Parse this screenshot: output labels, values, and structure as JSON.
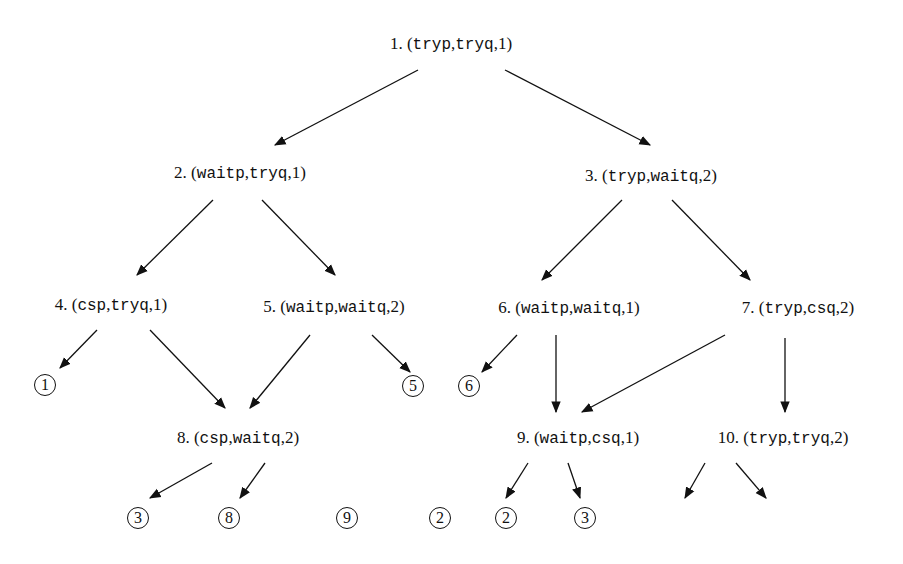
{
  "diagram": {
    "type": "state-space-tree",
    "nodes": [
      {
        "id": 1,
        "num": "1.",
        "p": "tryp",
        "q": "tryq",
        "t": "1",
        "x": 451,
        "y": 44
      },
      {
        "id": 2,
        "num": "2.",
        "p": "waitp",
        "q": "tryq",
        "t": "1",
        "x": 240,
        "y": 173
      },
      {
        "id": 3,
        "num": "3.",
        "p": "tryp",
        "q": "waitq",
        "t": "2",
        "x": 651,
        "y": 176
      },
      {
        "id": 4,
        "num": "4.",
        "p": "csp",
        "q": "tryq",
        "t": "1",
        "x": 111,
        "y": 305
      },
      {
        "id": 5,
        "num": "5.",
        "p": "waitp",
        "q": "waitq",
        "t": "2",
        "x": 334,
        "y": 307
      },
      {
        "id": 6,
        "num": "6.",
        "p": "waitp",
        "q": "waitq",
        "t": "1",
        "x": 569,
        "y": 308
      },
      {
        "id": 7,
        "num": "7.",
        "p": "tryp",
        "q": "csq",
        "t": "2",
        "x": 798,
        "y": 308
      },
      {
        "id": 8,
        "num": "8.",
        "p": "csp",
        "q": "waitq",
        "t": "2",
        "x": 238,
        "y": 438
      },
      {
        "id": 9,
        "num": "9.",
        "p": "waitp",
        "q": "csq",
        "t": "1",
        "x": 578,
        "y": 438
      },
      {
        "id": 10,
        "num": "10.",
        "p": "tryp",
        "q": "tryq",
        "t": "2",
        "x": 783,
        "y": 438
      }
    ],
    "refs": [
      {
        "label": "1",
        "x": 45,
        "y": 385
      },
      {
        "label": "5",
        "x": 413,
        "y": 386
      },
      {
        "label": "6",
        "x": 469,
        "y": 386
      },
      {
        "label": "3",
        "x": 138,
        "y": 518
      },
      {
        "label": "8",
        "x": 229,
        "y": 518
      },
      {
        "label": "9",
        "x": 347,
        "y": 518
      },
      {
        "label": "2",
        "x": 440,
        "y": 518
      },
      {
        "label": "2",
        "x": 506,
        "y": 518
      },
      {
        "label": "3",
        "x": 585,
        "y": 518
      }
    ],
    "edges": [
      [
        418,
        70,
        275,
        145
      ],
      [
        505,
        70,
        650,
        145
      ],
      [
        213,
        200,
        137,
        275
      ],
      [
        262,
        200,
        335,
        275
      ],
      [
        622,
        200,
        542,
        280
      ],
      [
        672,
        200,
        750,
        280
      ],
      [
        97,
        330,
        60,
        368
      ],
      [
        150,
        330,
        225,
        408
      ],
      [
        310,
        335,
        250,
        408
      ],
      [
        372,
        335,
        410,
        372
      ],
      [
        517,
        335,
        482,
        372
      ],
      [
        556,
        335,
        556,
        412
      ],
      [
        725,
        335,
        582,
        412
      ],
      [
        785,
        338,
        785,
        412
      ],
      [
        212,
        463,
        150,
        498
      ],
      [
        265,
        463,
        240,
        498
      ],
      [
        528,
        463,
        506,
        498
      ],
      [
        568,
        463,
        580,
        498
      ],
      [
        705,
        463,
        685,
        498
      ],
      [
        736,
        463,
        766,
        498
      ]
    ]
  }
}
